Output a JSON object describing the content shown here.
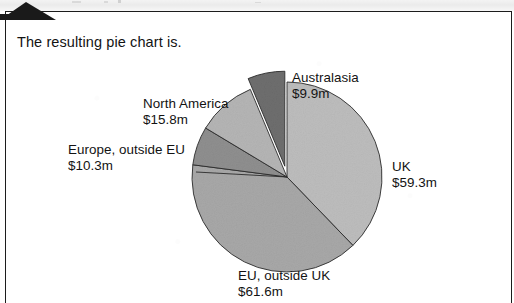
{
  "page": {
    "intro_text": "The resulting pie chart is."
  },
  "chart_data": {
    "type": "pie",
    "title": "",
    "units": "$m",
    "total": 156.9,
    "legend_position": "callout-labels",
    "grid": false,
    "categories": [
      "UK",
      "EU, outside UK",
      "Europe, outside EU",
      "North America",
      "Australasia"
    ],
    "values": [
      59.3,
      61.6,
      10.3,
      15.8,
      9.9
    ],
    "value_labels": [
      "$59.3m",
      "$61.6m",
      "$10.3m",
      "$15.8m",
      "$9.9m"
    ],
    "colors": [
      "#bdbdbd",
      "#a8a8a8",
      "#8f8f8f",
      "#b5b5b5",
      "#6e6e6e"
    ],
    "exploded": [
      false,
      false,
      false,
      false,
      true
    ],
    "start_angle_deg": 0,
    "direction": "clockwise",
    "slices": [
      {
        "label": "UK",
        "value_label": "$59.3m",
        "value": 59.3,
        "color": "#bdbdbd",
        "angle_deg": 136.1,
        "exploded": false
      },
      {
        "label": "EU, outside UK",
        "value_label": "$61.6m",
        "value": 61.6,
        "color": "#a8a8a8",
        "angle_deg": 141.4,
        "exploded": false
      },
      {
        "label": "Europe, outside EU",
        "value_label": "$10.3m",
        "value": 10.3,
        "color": "#8f8f8f",
        "angle_deg": 23.6,
        "exploded": false
      },
      {
        "label": "North America",
        "value_label": "$15.8m",
        "value": 15.8,
        "color": "#b5b5b5",
        "angle_deg": 36.3,
        "exploded": false
      },
      {
        "label": "Australasia",
        "value_label": "$9.9m",
        "value": 9.9,
        "color": "#6e6e6e",
        "angle_deg": 22.7,
        "exploded": true
      }
    ]
  }
}
